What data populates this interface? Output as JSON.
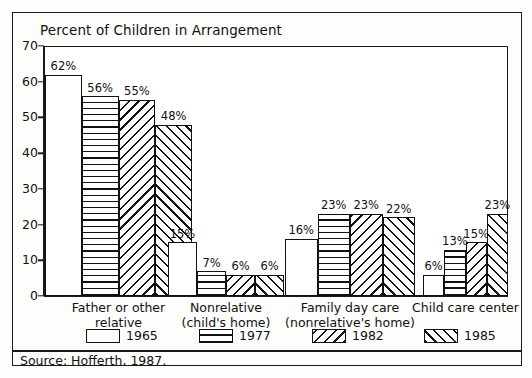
{
  "figure": {
    "title": "Percent of Children in Arrangement",
    "source_note": "Source: Hofferth, 1987."
  },
  "chart_data": {
    "type": "bar",
    "title": "Percent of Children in Arrangement",
    "xlabel": "",
    "ylabel": "",
    "ylim": [
      0,
      70
    ],
    "ytick_values": [
      0,
      10,
      20,
      30,
      40,
      50,
      60,
      70
    ],
    "ytick_labels": [
      "0",
      "10",
      "20",
      "30",
      "40",
      "50",
      "60",
      "70"
    ],
    "grid": false,
    "legend_position": "bottom",
    "value_suffix": "%",
    "categories": [
      "Father or other relative",
      "Nonrelative (child's home)",
      "Family day care (nonrelative's home)",
      "Child care center"
    ],
    "category_lines": [
      [
        "Father or other",
        "relative"
      ],
      [
        "Nonrelative",
        "(child's home)"
      ],
      [
        "Family day care",
        "(nonrelative's home)"
      ],
      [
        "Child care center"
      ]
    ],
    "series": [
      {
        "name": "1965",
        "pattern": "solid-white",
        "values": [
          62,
          15,
          16,
          6
        ],
        "labels": [
          "62%",
          "15%",
          "16%",
          "6%"
        ]
      },
      {
        "name": "1977",
        "pattern": "horizontal-lines",
        "values": [
          56,
          7,
          23,
          13
        ],
        "labels": [
          "56%",
          "7%",
          "23%",
          "13%"
        ]
      },
      {
        "name": "1982",
        "pattern": "backslash-diagonal",
        "values": [
          55,
          6,
          23,
          15
        ],
        "labels": [
          "55%",
          "6%",
          "23%",
          "15%"
        ]
      },
      {
        "name": "1985",
        "pattern": "forwardslash-diagonal",
        "values": [
          48,
          6,
          22,
          23
        ],
        "labels": [
          "48%",
          "6%",
          "22%",
          "23%"
        ]
      }
    ]
  },
  "legend": {
    "items": [
      {
        "label": "1965",
        "swatch": "legend-swatch-1965"
      },
      {
        "label": "1977",
        "swatch": "legend-swatch-1977"
      },
      {
        "label": "1982",
        "swatch": "legend-swatch-1982"
      },
      {
        "label": "1985",
        "swatch": "legend-swatch-1985"
      }
    ]
  }
}
